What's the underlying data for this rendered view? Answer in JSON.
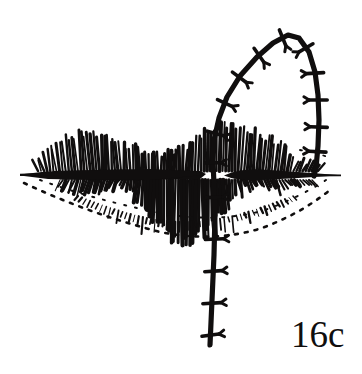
{
  "figure": {
    "caption": "16c",
    "style": "black-and-white pen-and-ink line drawing",
    "colors": {
      "ink": "#100e0e",
      "background": "#ffffff"
    },
    "parts": {
      "mouth_line_label": "mouth aperture",
      "upper_lip_label": "upper lip hatching",
      "lower_lip_label": "lower lip hatching",
      "suture_arc_label": "arched suture line over upper lip",
      "suture_vertical_label": "vertical suture line through lower lip",
      "stitch_label": "cross stitch"
    }
  },
  "geometry": {
    "canvas": {
      "width": 362,
      "height": 374
    },
    "mouth_line": {
      "left_x": 20,
      "right_x": 341,
      "y": 174,
      "thick_band": {
        "x0": 45,
        "x1": 205,
        "max_thickness": 13
      },
      "right_band": {
        "x0": 222,
        "x1": 290,
        "max_thickness": 9
      }
    },
    "suture_path": "M 210,345 L 212,300 L 214,255 L 215,215 L 214,185 L 213,160 L 214,140 L 219,118 L 227,97 L 240,76 L 257,57 L 273,43 L 288,35 L 299,38 L 309,52 L 315,72 L 318,95 L 319,120 L 318,146 L 316,168 L 314,176",
    "stitches": [
      {
        "t": 0.02,
        "len": 17,
        "skew": -10
      },
      {
        "t": 0.085,
        "len": 18,
        "skew": -6
      },
      {
        "t": 0.15,
        "len": 17,
        "skew": -6
      },
      {
        "t": 0.215,
        "len": 18,
        "skew": -4
      },
      {
        "t": 0.3,
        "len": 17,
        "skew": 0
      },
      {
        "t": 0.37,
        "len": 16,
        "skew": 2
      },
      {
        "t": 0.43,
        "len": 17,
        "skew": 3
      },
      {
        "t": 0.495,
        "len": 16,
        "skew": 4
      },
      {
        "t": 0.555,
        "len": 17,
        "skew": 5
      },
      {
        "t": 0.615,
        "len": 17,
        "skew": 6
      },
      {
        "t": 0.675,
        "len": 17,
        "skew": 6
      },
      {
        "t": 0.735,
        "len": 16,
        "skew": 5
      },
      {
        "t": 0.79,
        "len": 17,
        "skew": 4
      },
      {
        "t": 0.845,
        "len": 18,
        "skew": 2
      },
      {
        "t": 0.9,
        "len": 17,
        "skew": 0
      },
      {
        "t": 0.95,
        "len": 17,
        "skew": -2
      }
    ],
    "upper_hatch": {
      "baseline_y": 170,
      "x_start": 38,
      "x_end": 318,
      "count": 92
    },
    "lower_hatch": {
      "baseline_y": 181,
      "x_start": 60,
      "x_end": 312,
      "count": 86
    },
    "lower_contour": "M 24,183 Q 90,214 160,232 Q 215,243 262,228 Q 300,214 330,190"
  }
}
